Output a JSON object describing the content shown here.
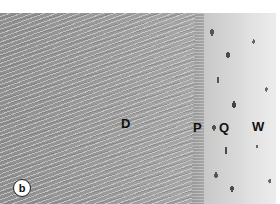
{
  "image": {
    "description": "Grayscale histology micrograph showing dentin with tubules, predentin, odontoblast layer, and pulp tissue",
    "panel_label": "b",
    "labels": {
      "D": "D",
      "P": "P",
      "Q": "Q",
      "W": "W"
    },
    "colors": {
      "dentin": "#9a9a9a",
      "cell_layer": "#d0d0d0",
      "pulp": "#e6e6e6",
      "label_text": "#111111",
      "top_margin": "#ffffff"
    }
  }
}
